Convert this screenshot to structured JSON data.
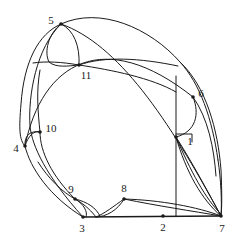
{
  "figure": {
    "kind": "planar-curve-arrangement-diagram",
    "background_color": "#ffffff",
    "line_color": "#1a1a1a",
    "width": 241,
    "height": 241
  },
  "vertices": [
    {
      "id": "1",
      "label": "1",
      "x": 176,
      "y": 137,
      "label_x": 190,
      "label_y": 141
    },
    {
      "id": "2",
      "label": "2",
      "x": 163,
      "y": 216,
      "label_x": 163,
      "label_y": 227
    },
    {
      "id": "3",
      "label": "3",
      "x": 83,
      "y": 217,
      "label_x": 82,
      "label_y": 228
    },
    {
      "id": "4",
      "label": "4",
      "x": 25,
      "y": 146,
      "label_x": 16,
      "label_y": 148
    },
    {
      "id": "5",
      "label": "5",
      "x": 61,
      "y": 24,
      "label_x": 51,
      "label_y": 20
    },
    {
      "id": "6",
      "label": "6",
      "x": 193,
      "y": 97,
      "label_x": 201,
      "label_y": 93
    },
    {
      "id": "7",
      "label": "7",
      "x": 221,
      "y": 216,
      "label_x": 222,
      "label_y": 228
    },
    {
      "id": "8",
      "label": "8",
      "x": 124,
      "y": 199,
      "label_x": 124,
      "label_y": 188
    },
    {
      "id": "9",
      "label": "9",
      "x": 75,
      "y": 199,
      "label_x": 71,
      "label_y": 189
    },
    {
      "id": "10",
      "label": "10",
      "x": 40,
      "y": 132,
      "label_x": 51,
      "label_y": 128
    },
    {
      "id": "11",
      "label": "11",
      "x": 79,
      "y": 65,
      "label_x": 86,
      "label_y": 75
    }
  ],
  "edges": [
    {
      "name": "outer-left-upper",
      "d": "M 61 24 C 38 34 24 62 21 104 C 19 128 19 140 25 146"
    },
    {
      "name": "outer-left-lower",
      "d": "M 25 146 C 30 168 50 197 83 217"
    },
    {
      "name": "outer-top-right",
      "d": "M 61 24 C 100 6 150 28 180 62 C 200 84 212 118 218 160"
    },
    {
      "name": "outer-right-lower",
      "d": "M 218 160 C 221 180 222 202 221 216"
    },
    {
      "name": "baseline-bottom",
      "d": "M 83 217 L 221 216"
    },
    {
      "name": "big-chord-5-to-7",
      "d": "M 61 24 C 118 44 168 118 221 216"
    },
    {
      "name": "big-chord-4-to-6",
      "d": "M 25 146 C 42 62 104 26 193 97"
    },
    {
      "name": "lens-left-outer",
      "d": "M 61 24 C 36 48 28 96 30 126 C 32 146 46 176 83 217"
    },
    {
      "name": "spine-5-to-11",
      "d": "M 61 24 C 74 30 80 46 79 65"
    },
    {
      "name": "arc-5-to-11-left",
      "d": "M 61 24 C 48 34 44 52 49 62 C 56 68 68 66 79 65"
    },
    {
      "name": "arc-11-to-left-rim",
      "d": "M 79 65 C 62 62 46 61 33 63"
    },
    {
      "name": "arc-11-up-right",
      "d": "M 79 65 C 104 56 140 58 178 66"
    },
    {
      "name": "arc-11-right-low",
      "d": "M 79 65 C 112 70 152 78 176 92"
    },
    {
      "name": "vertical-1-to-2",
      "d": "M 176 76 L 176 216"
    },
    {
      "name": "tick-at-1",
      "d": "M 176 134 L 192 134 L 192 142"
    },
    {
      "name": "arc-6-down-to-1",
      "d": "M 193 97 C 200 114 196 132 176 137"
    },
    {
      "name": "arc-1-to-7-upper",
      "d": "M 176 137 C 192 162 208 192 221 216"
    },
    {
      "name": "arc-1-to-7-lower",
      "d": "M 176 137 C 186 172 202 200 221 216"
    },
    {
      "name": "arc-1-to-7-flat",
      "d": "M 176 137 C 190 170 206 200 221 214"
    },
    {
      "name": "arc-8-to-7",
      "d": "M 124 199 C 160 200 198 207 221 216"
    },
    {
      "name": "arc-8-to-7-lower",
      "d": "M 124 199 C 158 206 192 211 221 216"
    },
    {
      "name": "arc-8-down-to-base",
      "d": "M 124 199 C 118 210 106 217 96 217"
    },
    {
      "name": "arc-8-left-to-base",
      "d": "M 124 199 C 114 206 104 214 96 217"
    },
    {
      "name": "arc-9-to-8-base",
      "d": "M 75 199 C 86 205 92 212 96 217"
    },
    {
      "name": "arc-9-curve-down",
      "d": "M 75 199 C 84 204 88 212 86 217"
    },
    {
      "name": "arc-9-to-left-rim",
      "d": "M 75 199 C 62 192 48 178 38 162"
    },
    {
      "name": "arc-9-outer-to-3",
      "d": "M 75 199 C 88 202 96 208 100 216"
    },
    {
      "name": "arc-4-to-10",
      "d": "M 25 146 C 28 136 34 130 40 132"
    },
    {
      "name": "arc-10-up",
      "d": "M 40 132 C 38 112 36 92 40 70"
    },
    {
      "name": "arc-10-loop-left",
      "d": "M 40 132 C 30 130 24 136 25 146"
    },
    {
      "name": "arc-10-down-to-9",
      "d": "M 40 132 C 40 152 52 176 75 199"
    },
    {
      "name": "lens-right-outer",
      "d": "M 180 62 C 206 86 218 130 221 170 C 222 192 222 208 221 216"
    },
    {
      "name": "arc-6-outer",
      "d": "M 193 97 C 208 118 214 148 216 176"
    }
  ]
}
